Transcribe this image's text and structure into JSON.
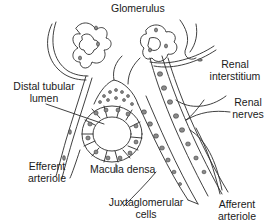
{
  "diagram": {
    "labels": {
      "glomerulus": "Glomerulus",
      "distal_tubular_lumen_1": "Distal tubular",
      "distal_tubular_lumen_2": "lumen",
      "renal_interstitium_1": "Renal",
      "renal_interstitium_2": "interstitium",
      "renal_nerves_1": "Renal",
      "renal_nerves_2": "nerves",
      "efferent_arteriole_1": "Efferent",
      "efferent_arteriole_2": "arteriole",
      "macula_densa": "Macula densa",
      "juxtaglomerular_cells_1": "Juxtaglomerular",
      "juxtaglomerular_cells_2": "cells",
      "afferent_arteriole_1": "Afferent",
      "afferent_arteriole_2": "arteriole"
    },
    "colors": {
      "line": "#2a2a2a",
      "nucleus": "#8a8a8a",
      "background": "#ffffff"
    }
  }
}
